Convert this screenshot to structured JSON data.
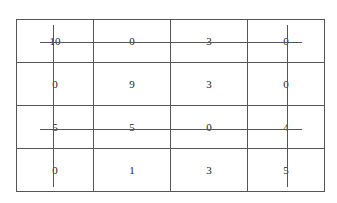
{
  "grid": {
    "rows": [
      [
        "10",
        "0",
        "3",
        "0"
      ],
      [
        "0",
        "9",
        "3",
        "0"
      ],
      [
        "5",
        "5",
        "0",
        "4"
      ],
      [
        "0",
        "1",
        "3",
        "5"
      ]
    ]
  },
  "lines": {
    "horizontal": [
      {
        "row": 0,
        "y": 42,
        "x1": 40,
        "x2": 302
      },
      {
        "row": 2,
        "y": 129,
        "x1": 40,
        "x2": 302
      }
    ],
    "vertical": [
      {
        "col": 0,
        "x": 53,
        "y1": 25,
        "y2": 187
      },
      {
        "col": 3,
        "x": 287,
        "y1": 25,
        "y2": 187
      }
    ]
  }
}
